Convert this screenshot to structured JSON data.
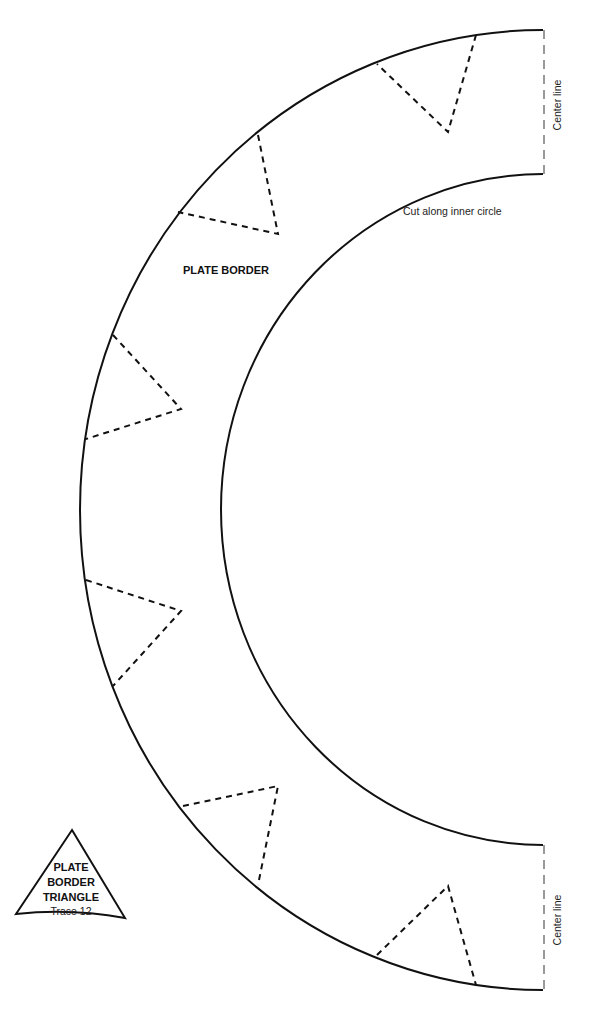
{
  "title": "PLATE BORDER",
  "labels": {
    "cut_instruction": "Cut along inner circle",
    "center_line_top": "Center line",
    "center_line_bottom": "Center line"
  },
  "trace_piece": {
    "line1": "PLATE",
    "line2": "BORDER",
    "line3": "TRIANGLE",
    "line4": "Trace 12"
  },
  "colors": {
    "outline": "#111111",
    "center_line": "#9a9a9a",
    "background": "#ffffff"
  },
  "fold_triangles_count": 6
}
